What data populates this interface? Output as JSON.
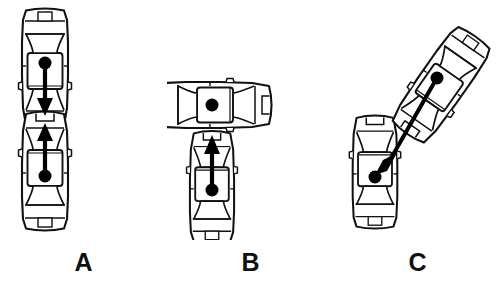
{
  "figure": {
    "background_color": "#ffffff",
    "line_color": "#111111",
    "fill_color": "#ffffff",
    "marker_color": "#000000",
    "view": "top-down",
    "label_font_weight": "bold",
    "label_font_size_px": 25
  },
  "panels": [
    {
      "id": "a",
      "label": "A",
      "scenario_name": "head-on-collision",
      "vehicle_count": 2,
      "vehicles": [
        {
          "name": "upper-vehicle",
          "orientation_deg": 180,
          "center_x": 45,
          "center_y": 68,
          "length": 118,
          "width": 46,
          "cg_marker": true,
          "arrow": {
            "direction": "down",
            "from_x": 45,
            "from_y": 72,
            "to_x": 45,
            "to_y": 112
          }
        },
        {
          "name": "lower-vehicle",
          "orientation_deg": 0,
          "center_x": 45,
          "center_y": 171,
          "length": 118,
          "width": 46,
          "cg_marker": true,
          "arrow": {
            "direction": "up",
            "from_x": 45,
            "from_y": 167,
            "to_x": 45,
            "to_y": 127
          }
        }
      ],
      "impact_point": {
        "x": 45,
        "y": 119
      }
    },
    {
      "id": "b",
      "label": "B",
      "scenario_name": "perpendicular-side-impact",
      "vehicle_count": 2,
      "vehicles": [
        {
          "name": "struck-vehicle",
          "orientation_deg": 90,
          "center_x": 212,
          "center_y": 105,
          "length": 118,
          "width": 46,
          "cg_marker": true,
          "arrow": null
        },
        {
          "name": "striking-vehicle",
          "orientation_deg": 0,
          "center_x": 212,
          "center_y": 185,
          "length": 110,
          "width": 46,
          "cg_marker": true,
          "arrow": {
            "direction": "up",
            "from_x": 212,
            "from_y": 180,
            "to_x": 212,
            "to_y": 136
          }
        }
      ],
      "impact_point": {
        "x": 212,
        "y": 129
      }
    },
    {
      "id": "c",
      "label": "C",
      "scenario_name": "oblique-angled-impact",
      "vehicle_count": 2,
      "vehicles": [
        {
          "name": "struck-vehicle",
          "orientation_deg": 0,
          "center_x": 375,
          "center_y": 172,
          "length": 112,
          "width": 46,
          "cg_marker": true,
          "arrow": null
        },
        {
          "name": "striking-vehicle",
          "orientation_deg": 35,
          "center_x": 441,
          "center_y": 85,
          "length": 118,
          "width": 46,
          "cg_marker": true,
          "arrow": {
            "direction": "down-left",
            "from_x": 434,
            "from_y": 98,
            "to_x": 377,
            "to_y": 173
          }
        }
      ],
      "impact_point": {
        "x": 398,
        "y": 130
      }
    }
  ]
}
